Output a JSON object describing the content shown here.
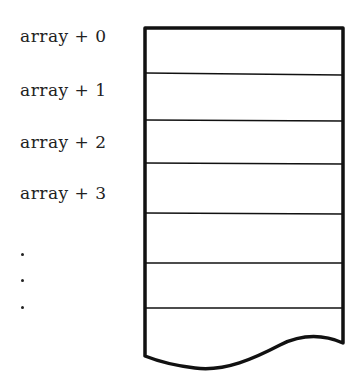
{
  "diagram": {
    "type": "memory-array",
    "labels": [
      "array + 0",
      "array + 1",
      "array + 2",
      "array + 3"
    ],
    "continuation": [
      "•",
      "•",
      "•"
    ],
    "cells_visible": 7,
    "colors": {
      "stroke": "#111111",
      "background": "#ffffff",
      "text": "#222222"
    }
  }
}
